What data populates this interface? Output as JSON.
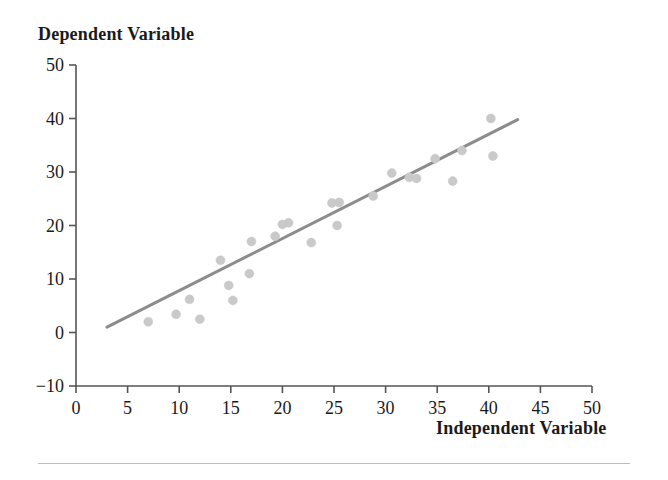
{
  "chart_data": {
    "type": "scatter",
    "title": "Dependent Variable",
    "xlabel": "Independent Variable",
    "ylabel": "Dependent Variable",
    "xlim": [
      0,
      50
    ],
    "ylim": [
      -10,
      50
    ],
    "xticks": [
      0,
      5,
      10,
      15,
      20,
      25,
      30,
      35,
      40,
      45,
      50
    ],
    "yticks": [
      -10,
      0,
      10,
      20,
      30,
      40,
      50
    ],
    "xtick_labels": [
      "0",
      "5",
      "10",
      "15",
      "20",
      "25",
      "30",
      "35",
      "40",
      "45",
      "50"
    ],
    "ytick_labels": [
      "-10",
      "0",
      "10",
      "20",
      "30",
      "40",
      "50"
    ],
    "grid": false,
    "legend": null,
    "marker": {
      "shape": "circle",
      "color": "#c9c9c9",
      "size": 9
    },
    "series": [
      {
        "name": "observations",
        "points": [
          [
            7.0,
            2.0
          ],
          [
            9.7,
            3.4
          ],
          [
            11.0,
            6.2
          ],
          [
            12.0,
            2.5
          ],
          [
            14.0,
            13.5
          ],
          [
            14.8,
            8.8
          ],
          [
            15.2,
            6.0
          ],
          [
            16.8,
            11.0
          ],
          [
            17.0,
            17.0
          ],
          [
            19.3,
            18.0
          ],
          [
            20.0,
            20.2
          ],
          [
            20.6,
            20.5
          ],
          [
            22.8,
            16.8
          ],
          [
            24.8,
            24.2
          ],
          [
            25.3,
            20.0
          ],
          [
            25.5,
            24.3
          ],
          [
            28.8,
            25.5
          ],
          [
            30.6,
            29.8
          ],
          [
            32.3,
            29.0
          ],
          [
            33.0,
            28.8
          ],
          [
            34.8,
            32.5
          ],
          [
            36.5,
            28.3
          ],
          [
            37.4,
            34.0
          ],
          [
            40.4,
            33.0
          ],
          [
            40.2,
            40.0
          ]
        ]
      }
    ],
    "trendline": {
      "name": "linear fit",
      "color": "#8c8c8c",
      "width": 3,
      "x_start": 3.0,
      "y_start": 1.0,
      "x_end": 42.8,
      "y_end": 39.8
    },
    "axis_color": "#555555",
    "text_color": "#1a1a1a"
  }
}
